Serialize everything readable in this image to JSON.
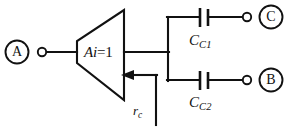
{
  "figure": {
    "type": "circuit-schematic",
    "background_color": "#ffffff",
    "line_color": "#111111",
    "width": 289,
    "height": 131
  },
  "amplifier": {
    "label": "Ai",
    "equals": "=1",
    "full_label": "Ai=1",
    "shape": "trapezoid"
  },
  "terminals": [
    {
      "id": "terminal-a",
      "label": "A",
      "side": "left",
      "style": "circled-letter"
    },
    {
      "id": "terminal-c",
      "label": "C",
      "side": "right-top",
      "style": "circled-letter"
    },
    {
      "id": "terminal-b",
      "label": "B",
      "side": "right-bottom",
      "style": "circled-letter"
    }
  ],
  "components": [
    {
      "id": "cap-cc1",
      "type": "capacitor",
      "symbol": "C",
      "subscript": "C1",
      "label": "C",
      "branch": "top"
    },
    {
      "id": "cap-cc2",
      "type": "capacitor",
      "symbol": "C",
      "subscript": "C2",
      "label": "C",
      "branch": "bottom"
    }
  ],
  "annotations": [
    {
      "id": "rc-annotation",
      "symbol": "r",
      "subscript": "c",
      "label": "r",
      "arrow_direction": "left"
    }
  ]
}
